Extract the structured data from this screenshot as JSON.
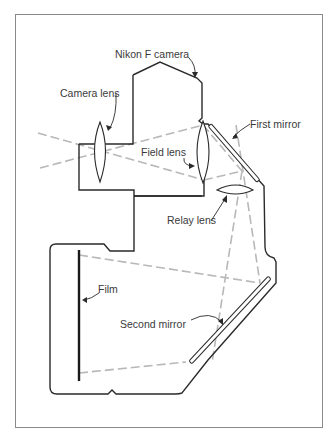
{
  "diagram": {
    "labels": {
      "camera": "Nikon F camera",
      "camera_lens": "Camera lens",
      "field_lens": "Field lens",
      "first_mirror": "First mirror",
      "relay_lens": "Relay lens",
      "film": "Film",
      "second_mirror": "Second mirror"
    },
    "colors": {
      "outline": "#2a2a2a",
      "rays": "#b8b8b8",
      "frame": "#8a8a8a",
      "text": "#3a3a3a"
    }
  }
}
